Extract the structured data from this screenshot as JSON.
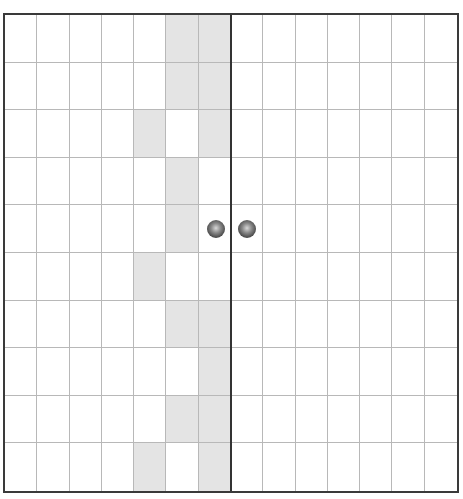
{
  "board": {
    "columns": 14,
    "rows": 10,
    "divider_after_column": 7,
    "colors": {
      "background": "#ffffff",
      "shaded": "#e4e4e4",
      "grid_line": "#b8b8b8",
      "border": "#3a3a3a",
      "divider": "#333333"
    },
    "shaded_cells": [
      [
        0,
        5
      ],
      [
        0,
        6
      ],
      [
        1,
        5
      ],
      [
        1,
        6
      ],
      [
        2,
        4
      ],
      [
        2,
        6
      ],
      [
        3,
        5
      ],
      [
        4,
        5
      ],
      [
        5,
        4
      ],
      [
        6,
        5
      ],
      [
        6,
        6
      ],
      [
        7,
        6
      ],
      [
        8,
        5
      ],
      [
        8,
        6
      ],
      [
        9,
        4
      ],
      [
        9,
        6
      ]
    ],
    "pieces": [
      {
        "type": "ball",
        "row": 4,
        "col": 6
      },
      {
        "type": "ball",
        "row": 4,
        "col": 7
      }
    ]
  }
}
